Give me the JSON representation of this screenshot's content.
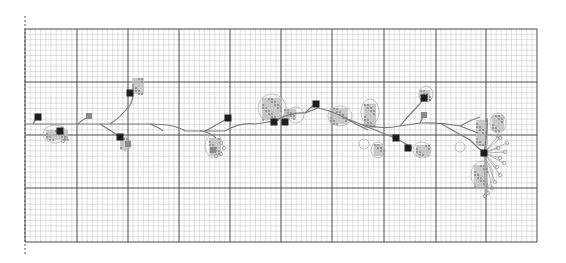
{
  "diagram": {
    "type": "node-network-on-graph-paper",
    "grid": {
      "x0": 25,
      "y0": 29,
      "x1": 537,
      "y1": 242,
      "major_x": [
        25,
        77,
        128,
        179,
        230,
        281,
        332,
        384,
        436,
        486,
        537
      ],
      "major_y": [
        29,
        82,
        135,
        188,
        242
      ],
      "minor_step": 5.12
    },
    "colors": {
      "background": "#ffffff",
      "minor_grid": "#c9c9c9",
      "major_grid": "#4a4a4a",
      "edge": "#7a7a7a",
      "node_dark": "#1e1e1e",
      "node_mid": "#8a8a8a",
      "cluster": "#b9b9b9"
    },
    "main_path": "M25,124 L60,124 L110,124 L150,124 Q175,124 185,131 L225,131 Q240,122 255,124 L275,121 Q290,112 305,113 L318,108 Q335,112 345,118 L360,124 Q380,130 400,126 L420,123 Q440,122 460,126 L478,133",
    "branches": [
      "M33,124 Q36,118 38,117",
      "M110,124 Q120,118 130,105 Q134,98 132,93",
      "M78,124 Q84,118 90,117",
      "M100,124 Q110,130 120,137",
      "M150,124 Q160,128 163,131",
      "M205,131 Q215,126 228,118",
      "M200,131 Q210,132 216,138",
      "M305,113 Q310,108 316,103",
      "M345,118 Q355,124 368,130",
      "M360,124 Q375,130 395,138",
      "M395,138 Q405,143 412,148",
      "M400,126 Q408,116 416,108 Q421,103 424,98",
      "M420,123 Q423,117 424,115",
      "M440,123 Q452,130 470,140 Q478,148 484,153",
      "M460,126 Q470,120 480,117",
      "M487,118 Q488,130 484,153"
    ],
    "dark_nodes": [
      {
        "x": 38,
        "y": 117
      },
      {
        "x": 60,
        "y": 131
      },
      {
        "x": 120,
        "y": 137
      },
      {
        "x": 130,
        "y": 93
      },
      {
        "x": 228,
        "y": 118
      },
      {
        "x": 274,
        "y": 122
      },
      {
        "x": 285,
        "y": 122
      },
      {
        "x": 316,
        "y": 104
      },
      {
        "x": 396,
        "y": 138
      },
      {
        "x": 408,
        "y": 148
      },
      {
        "x": 424,
        "y": 98
      },
      {
        "x": 484,
        "y": 153
      }
    ],
    "mid_nodes": [
      {
        "x": 89,
        "y": 116
      },
      {
        "x": 424,
        "y": 115
      },
      {
        "x": 128,
        "y": 144
      },
      {
        "x": 213,
        "y": 150
      }
    ],
    "clusters": [
      {
        "x": 132,
        "y": 78,
        "w": 12,
        "h": 16
      },
      {
        "x": 46,
        "y": 130,
        "w": 22,
        "h": 10
      },
      {
        "x": 120,
        "y": 138,
        "w": 8,
        "h": 12
      },
      {
        "x": 209,
        "y": 138,
        "w": 12,
        "h": 18
      },
      {
        "x": 262,
        "y": 98,
        "w": 20,
        "h": 22
      },
      {
        "x": 284,
        "y": 109,
        "w": 12,
        "h": 10
      },
      {
        "x": 330,
        "y": 108,
        "w": 18,
        "h": 16
      },
      {
        "x": 364,
        "y": 104,
        "w": 12,
        "h": 24
      },
      {
        "x": 374,
        "y": 144,
        "w": 10,
        "h": 12
      },
      {
        "x": 416,
        "y": 145,
        "w": 14,
        "h": 12
      },
      {
        "x": 420,
        "y": 90,
        "w": 10,
        "h": 10
      },
      {
        "x": 476,
        "y": 120,
        "w": 12,
        "h": 26
      },
      {
        "x": 492,
        "y": 115,
        "w": 12,
        "h": 16
      },
      {
        "x": 474,
        "y": 165,
        "w": 14,
        "h": 22
      }
    ],
    "bubbles": [
      {
        "cx": 55,
        "cy": 134,
        "rx": 12,
        "ry": 9
      },
      {
        "cx": 272,
        "cy": 108,
        "rx": 14,
        "ry": 14
      },
      {
        "cx": 296,
        "cy": 115,
        "rx": 8,
        "ry": 8
      },
      {
        "cx": 340,
        "cy": 116,
        "rx": 12,
        "ry": 10
      },
      {
        "cx": 370,
        "cy": 112,
        "rx": 9,
        "ry": 13
      },
      {
        "cx": 378,
        "cy": 150,
        "rx": 7,
        "ry": 8
      },
      {
        "cx": 422,
        "cy": 150,
        "rx": 9,
        "ry": 8
      },
      {
        "cx": 426,
        "cy": 94,
        "rx": 7,
        "ry": 8
      },
      {
        "cx": 498,
        "cy": 123,
        "rx": 8,
        "ry": 10
      },
      {
        "cx": 482,
        "cy": 175,
        "rx": 11,
        "ry": 14
      },
      {
        "cx": 126,
        "cy": 144,
        "rx": 5,
        "ry": 7
      },
      {
        "cx": 214,
        "cy": 146,
        "rx": 9,
        "ry": 12
      },
      {
        "cx": 460,
        "cy": 147,
        "rx": 5,
        "ry": 5
      },
      {
        "cx": 364,
        "cy": 144,
        "rx": 5,
        "ry": 5
      }
    ],
    "leaf_fan": {
      "origin": {
        "x": 484,
        "y": 153
      },
      "leaves": [
        {
          "x": 500,
          "y": 138
        },
        {
          "x": 507,
          "y": 143
        },
        {
          "x": 498,
          "y": 148
        },
        {
          "x": 505,
          "y": 152
        },
        {
          "x": 500,
          "y": 158
        },
        {
          "x": 504,
          "y": 163
        },
        {
          "x": 497,
          "y": 167
        },
        {
          "x": 500,
          "y": 175
        },
        {
          "x": 495,
          "y": 182
        },
        {
          "x": 492,
          "y": 188
        },
        {
          "x": 488,
          "y": 193
        },
        {
          "x": 485,
          "y": 196
        },
        {
          "x": 498,
          "y": 136
        }
      ]
    },
    "small_leaves": [
      {
        "x": 216,
        "y": 156
      },
      {
        "x": 221,
        "y": 154
      },
      {
        "x": 224,
        "y": 148
      },
      {
        "x": 221,
        "y": 143
      },
      {
        "x": 66,
        "y": 138
      },
      {
        "x": 63,
        "y": 141
      }
    ]
  }
}
